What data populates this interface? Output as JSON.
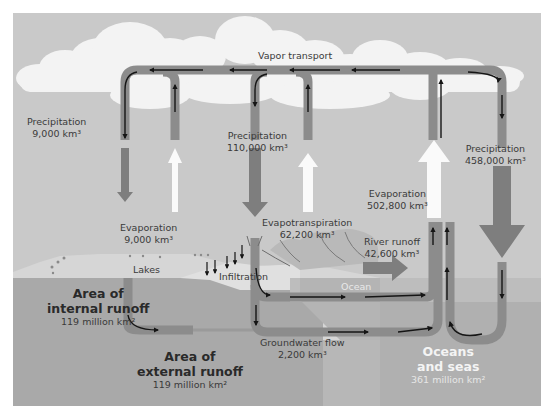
{
  "diagram": {
    "colors": {
      "sky": "#c9c9c9",
      "cloud": "#f3f3f3",
      "land_surface": "#d6d6d6",
      "land_dark": "#a9a9a9",
      "ocean_surface": "#bdbdbd",
      "ocean_deep": "#b0b0b0",
      "pipe": "#8c8c8c",
      "arrow_line": "#151515",
      "evap_arrow": "#fafafa",
      "precip_arrow": "#7e7e7e"
    },
    "labels": {
      "vapor_transport": "Vapor transport",
      "precip_left": {
        "title": "Precipitation",
        "value": "9,000 km³"
      },
      "precip_mid": {
        "title": "Precipitation",
        "value": "110,000 km³"
      },
      "precip_right": {
        "title": "Precipitation",
        "value": "458,000 km³"
      },
      "evap_left": {
        "title": "Evaporation",
        "value": "9,000 km³"
      },
      "evap_ocean": {
        "title": "Evaporation",
        "value": "502,800 km³"
      },
      "evapotranspiration": {
        "title": "Evapotranspiration",
        "value": "62,200 km³"
      },
      "river_runoff": {
        "title": "River runoff",
        "value": "42,600 km³"
      },
      "lakes": "Lakes",
      "infiltration": "Infiltration",
      "ocean": "Ocean",
      "groundwater": {
        "title": "Groundwater flow",
        "value": "2,200 km³"
      },
      "internal_runoff": {
        "line1": "Area of",
        "line2": "internal runoff",
        "value": "119 million km²"
      },
      "external_runoff": {
        "line1": "Area of",
        "line2": "external runoff",
        "value": "119 million km²"
      },
      "oceans": {
        "line1": "Oceans",
        "line2": "and seas",
        "value": "361 million km²"
      }
    }
  }
}
